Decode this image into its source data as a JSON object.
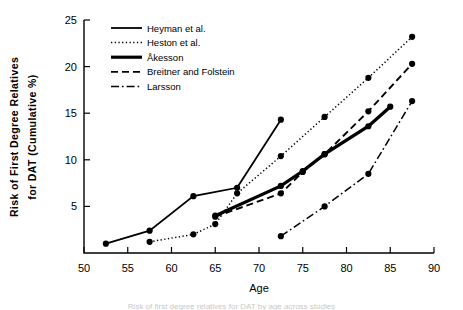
{
  "figure": {
    "caption_fragment": "Risk of first degree relatives for DAT by age across studies"
  },
  "axes": {
    "xlabel": "Age",
    "ylabel_line1": "Risk of First Degree Relatives",
    "ylabel_line2": "for DAT (Cumulative %)",
    "x_ticks": [
      "50",
      "55",
      "60",
      "65",
      "70",
      "75",
      "80",
      "85",
      "90"
    ],
    "y_ticks": [
      "5",
      "10",
      "15",
      "20",
      "25"
    ]
  },
  "legend": {
    "items": [
      {
        "label": "Heyman et al.",
        "style": "solid",
        "width": 1.8
      },
      {
        "label": "Heston et al.",
        "style": "dotted",
        "width": 1.5
      },
      {
        "label": "Åkesson",
        "style": "solid",
        "width": 3.2
      },
      {
        "label": "Breitner and Folstein",
        "style": "dashed",
        "width": 1.8
      },
      {
        "label": "Larsson",
        "style": "dashdot",
        "width": 1.5
      }
    ]
  },
  "chart_data": {
    "type": "line",
    "title": "",
    "xlabel": "Age",
    "ylabel": "Risk of First Degree Relatives for DAT (Cumulative %)",
    "xlim": [
      50,
      90
    ],
    "ylim": [
      0,
      25
    ],
    "xticks": [
      50,
      55,
      60,
      65,
      70,
      75,
      80,
      85,
      90
    ],
    "yticks": [
      5,
      10,
      15,
      20,
      25
    ],
    "grid": false,
    "legend_position": "upper-left-inside",
    "markers": "filled-circle",
    "series": [
      {
        "name": "Heyman et al.",
        "style": "solid",
        "points": [
          [
            52.5,
            1.0
          ],
          [
            57.5,
            2.4
          ],
          [
            62.5,
            6.1
          ],
          [
            67.5,
            7.0
          ],
          [
            72.5,
            14.3
          ]
        ]
      },
      {
        "name": "Heston et al.",
        "style": "dotted",
        "points": [
          [
            57.5,
            1.2
          ],
          [
            62.5,
            2.0
          ],
          [
            65.0,
            3.1
          ],
          [
            67.5,
            6.4
          ],
          [
            72.5,
            10.4
          ],
          [
            77.5,
            14.6
          ],
          [
            82.5,
            18.8
          ],
          [
            87.5,
            23.2
          ]
        ]
      },
      {
        "name": "Åkesson",
        "style": "solid-thick",
        "points": [
          [
            65.0,
            4.0
          ],
          [
            72.5,
            7.2
          ],
          [
            75.0,
            8.8
          ],
          [
            77.5,
            10.6
          ],
          [
            82.5,
            13.6
          ],
          [
            85.0,
            15.7
          ]
        ]
      },
      {
        "name": "Breitner and Folstein",
        "style": "dashed",
        "points": [
          [
            65.0,
            3.9
          ],
          [
            72.5,
            6.4
          ],
          [
            75.0,
            8.7
          ],
          [
            77.5,
            10.6
          ],
          [
            82.5,
            15.2
          ],
          [
            87.5,
            20.3
          ]
        ]
      },
      {
        "name": "Larsson",
        "style": "dashdot",
        "points": [
          [
            72.5,
            1.8
          ],
          [
            77.5,
            5.0
          ],
          [
            82.5,
            8.5
          ],
          [
            87.5,
            16.3
          ]
        ]
      }
    ]
  }
}
